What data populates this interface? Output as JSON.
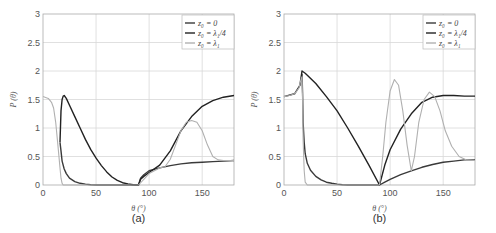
{
  "chart_data": [
    {
      "type": "line",
      "caption": "(a)",
      "xlabel": "θ (°)",
      "ylabel": "P (θ)",
      "xlim": [
        0,
        180
      ],
      "ylim": [
        0,
        3
      ],
      "xticks": [
        0,
        50,
        100,
        150
      ],
      "yticks": [
        0,
        0.5,
        1,
        1.5,
        2,
        2.5,
        3
      ],
      "grid": true,
      "legend_position": "upper right",
      "series": [
        {
          "name": "z0 = 0",
          "legend": "z₀ = 0",
          "color": "#3a3a3a",
          "x": [
            16,
            17,
            18,
            20,
            22,
            25,
            30,
            35,
            40,
            45,
            50,
            55,
            60,
            65,
            90,
            92,
            95,
            100,
            110,
            120,
            130,
            140,
            150,
            160,
            170,
            180
          ],
          "y": [
            0.75,
            0.6,
            0.42,
            0.28,
            0.2,
            0.12,
            0.06,
            0.03,
            0.015,
            0.005,
            0.0,
            0,
            0,
            0,
            0,
            0.12,
            0.18,
            0.25,
            0.3,
            0.34,
            0.37,
            0.39,
            0.4,
            0.41,
            0.42,
            0.43
          ]
        },
        {
          "name": "z0 = λ1/4",
          "legend": "z₀ = λ₁/4",
          "color": "#222222",
          "x": [
            16,
            17,
            18,
            19,
            20,
            22,
            25,
            30,
            35,
            40,
            45,
            50,
            55,
            60,
            65,
            70,
            75,
            80,
            85,
            88,
            90,
            92,
            95,
            100,
            110,
            120,
            130,
            140,
            150,
            160,
            170,
            180
          ],
          "y": [
            0.75,
            1.3,
            1.5,
            1.56,
            1.57,
            1.52,
            1.4,
            1.2,
            1.0,
            0.8,
            0.62,
            0.47,
            0.34,
            0.23,
            0.14,
            0.08,
            0.04,
            0.02,
            0.005,
            0,
            0,
            0.1,
            0.15,
            0.22,
            0.35,
            0.6,
            0.95,
            1.2,
            1.38,
            1.48,
            1.54,
            1.57
          ]
        },
        {
          "name": "z0 = λ1",
          "legend": "z₀ = λ₁",
          "color": "#b0b0b0",
          "x": [
            0,
            5,
            8,
            10,
            12,
            14,
            16,
            17,
            18,
            19,
            20,
            88,
            90,
            95,
            100,
            110,
            115,
            120,
            125,
            130,
            135,
            140,
            145,
            150,
            155,
            160,
            165,
            170,
            180
          ],
          "y": [
            1.55,
            1.52,
            1.45,
            1.35,
            1.1,
            0.7,
            0.3,
            0.12,
            0.03,
            0,
            0,
            0,
            0,
            0.1,
            0.2,
            0.3,
            0.32,
            0.45,
            0.7,
            0.95,
            1.1,
            1.13,
            1.1,
            0.95,
            0.7,
            0.5,
            0.44,
            0.43,
            0.43
          ]
        }
      ]
    },
    {
      "type": "line",
      "caption": "(b)",
      "xlabel": "θ (°)",
      "ylabel": "P (θ)",
      "xlim": [
        0,
        180
      ],
      "ylim": [
        0,
        3
      ],
      "xticks": [
        0,
        50,
        100,
        150
      ],
      "yticks": [
        0,
        0.5,
        1,
        1.5,
        2,
        2.5,
        3
      ],
      "grid": true,
      "legend_position": "upper right",
      "series": [
        {
          "name": "z0 = 0",
          "legend": "z₀ = 0",
          "color": "#3a3a3a",
          "x": [
            17,
            17.5,
            18,
            19,
            20,
            22,
            25,
            30,
            35,
            40,
            45,
            50,
            55,
            60,
            70,
            90,
            95,
            100,
            110,
            120,
            130,
            140,
            150,
            160,
            170,
            180
          ],
          "y": [
            1.95,
            1.6,
            1.1,
            0.75,
            0.55,
            0.38,
            0.26,
            0.15,
            0.09,
            0.05,
            0.03,
            0.015,
            0.005,
            0,
            0,
            0,
            0.05,
            0.1,
            0.18,
            0.25,
            0.31,
            0.36,
            0.4,
            0.42,
            0.44,
            0.44
          ]
        },
        {
          "name": "z0 = λ1/4",
          "legend": "z₀ = λ₁/4",
          "color": "#222222",
          "x": [
            17,
            20,
            30,
            40,
            50,
            60,
            70,
            80,
            90,
            95,
            100,
            110,
            120,
            130,
            140,
            150,
            160,
            170,
            180
          ],
          "y": [
            2.0,
            1.96,
            1.78,
            1.55,
            1.3,
            1.0,
            0.68,
            0.35,
            0,
            0.35,
            0.62,
            0.98,
            1.25,
            1.45,
            1.54,
            1.57,
            1.57,
            1.56,
            1.56
          ],
          "prefix_x": [
            0,
            10,
            15,
            17
          ],
          "prefix_y": [
            1.55,
            1.6,
            1.75,
            2.0
          ]
        },
        {
          "name": "z0 = λ1",
          "legend": "z₀ = λ₁",
          "color": "#b0b0b0",
          "x": [
            0,
            5,
            10,
            14,
            16,
            17,
            17.5,
            18,
            19,
            20,
            22,
            90,
            93,
            96,
            100,
            104,
            108,
            112,
            116,
            120,
            123,
            127,
            132,
            137,
            142,
            147,
            152,
            158,
            165,
            172,
            180
          ],
          "y": [
            1.55,
            1.57,
            1.6,
            1.7,
            1.85,
            1.9,
            1.5,
            0.8,
            0.25,
            0.05,
            0,
            0,
            0.5,
            1.1,
            1.65,
            1.85,
            1.75,
            1.3,
            0.7,
            0.25,
            0.5,
            1.1,
            1.5,
            1.63,
            1.55,
            1.3,
            0.95,
            0.68,
            0.5,
            0.44,
            0.43
          ]
        }
      ]
    }
  ]
}
